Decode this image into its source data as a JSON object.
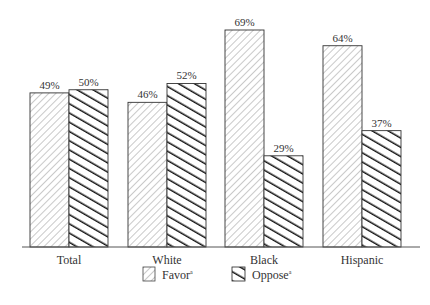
{
  "chart_data": {
    "type": "bar",
    "title": "",
    "xlabel": "",
    "ylabel": "",
    "ylim": [
      0,
      70
    ],
    "grid": false,
    "legend_position": "bottom-center",
    "categories": [
      "Total",
      "White",
      "Black",
      "Hispanic"
    ],
    "series": [
      {
        "name": "Favor",
        "footnote": "a",
        "pattern": "light-diagonal-hatch",
        "values": [
          49,
          46,
          69,
          64
        ]
      },
      {
        "name": "Oppose",
        "footnote": "a",
        "pattern": "heavy-diagonal-hatch",
        "values": [
          50,
          52,
          29,
          37
        ]
      }
    ],
    "value_labels": [
      [
        "49%",
        "46%",
        "69%",
        "64%"
      ],
      [
        "50%",
        "52%",
        "29%",
        "37%"
      ]
    ]
  },
  "colors": {
    "outline": "#333333",
    "favor_hatch": "#777777",
    "oppose_hatch": "#111111",
    "background": "#ffffff"
  }
}
